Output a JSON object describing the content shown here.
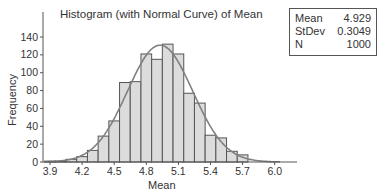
{
  "chart_data": {
    "type": "bar",
    "title": "Histogram (with Normal Curve) of Mean",
    "xlabel": "Mean",
    "ylabel": "Frequency",
    "categories": [
      "3.9",
      "4.0",
      "4.1",
      "4.2",
      "4.3",
      "4.4",
      "4.5",
      "4.6",
      "4.7",
      "4.8",
      "4.9",
      "5.0",
      "5.1",
      "5.2",
      "5.3",
      "5.4",
      "5.5",
      "5.6",
      "5.7"
    ],
    "values": [
      1,
      1,
      3,
      6,
      13,
      29,
      46,
      89,
      90,
      121,
      115,
      132,
      121,
      77,
      66,
      30,
      27,
      12,
      8
    ],
    "bin_width": 0.1,
    "xticks": [
      "3.9",
      "4.2",
      "4.5",
      "4.8",
      "5.1",
      "5.4",
      "5.7",
      "6.0"
    ],
    "yticks": [
      "0",
      "20",
      "40",
      "60",
      "80",
      "100",
      "120",
      "140"
    ],
    "xlim": [
      3.85,
      6.05
    ],
    "ylim": [
      0,
      140
    ],
    "overlay": {
      "type": "normal_curve",
      "mean": 4.929,
      "stdev": 0.3049,
      "n": 1000
    },
    "grid": false,
    "legend_position": "top-right"
  },
  "legend": {
    "rows": [
      {
        "label": "Mean",
        "value": "4.929"
      },
      {
        "label": "StDev",
        "value": "0.3049"
      },
      {
        "label": "N",
        "value": "1000"
      }
    ]
  },
  "colors": {
    "bar_fill": "#dcdcdc",
    "bar_edge": "#555555",
    "curve": "#808080",
    "axis": "#555555"
  }
}
